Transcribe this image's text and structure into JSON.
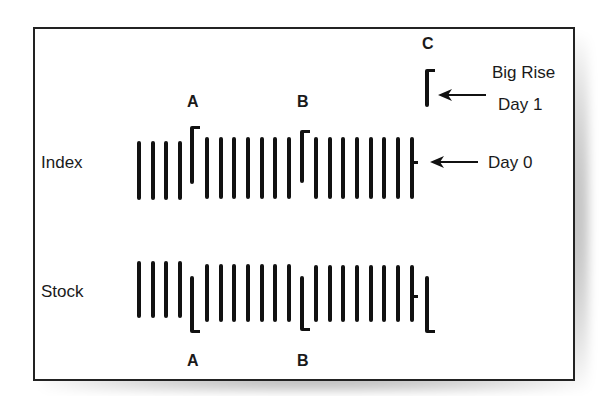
{
  "figure": {
    "row_labels": {
      "index": "Index",
      "stock": "Stock"
    },
    "markers": {
      "a_top": "A",
      "b_top": "B",
      "c_top": "C",
      "a_bottom": "A",
      "b_bottom": "B"
    },
    "annotations": {
      "big_rise": "Big Rise",
      "day1": "Day 1",
      "day0": "Day 0"
    },
    "colors": {
      "ink": "#111111",
      "background": "#ffffff",
      "frame": "#222222"
    }
  },
  "index_bars": [
    {
      "x": 139,
      "top": 141,
      "bottom": 200
    },
    {
      "x": 153,
      "top": 141,
      "bottom": 200
    },
    {
      "x": 166,
      "top": 141,
      "bottom": 200
    },
    {
      "x": 180,
      "top": 141,
      "bottom": 200
    },
    {
      "x": 192,
      "top": 126,
      "bottom": 184,
      "flag": "top"
    },
    {
      "x": 207,
      "top": 137,
      "bottom": 199
    },
    {
      "x": 221,
      "top": 137,
      "bottom": 199
    },
    {
      "x": 234,
      "top": 137,
      "bottom": 199
    },
    {
      "x": 248,
      "top": 137,
      "bottom": 199
    },
    {
      "x": 262,
      "top": 137,
      "bottom": 199
    },
    {
      "x": 275,
      "top": 137,
      "bottom": 199
    },
    {
      "x": 289,
      "top": 137,
      "bottom": 199
    },
    {
      "x": 302,
      "top": 130,
      "bottom": 183,
      "flag": "top"
    },
    {
      "x": 316,
      "top": 137,
      "bottom": 199
    },
    {
      "x": 330,
      "top": 137,
      "bottom": 199
    },
    {
      "x": 343,
      "top": 137,
      "bottom": 199
    },
    {
      "x": 357,
      "top": 137,
      "bottom": 199
    },
    {
      "x": 371,
      "top": 137,
      "bottom": 199
    },
    {
      "x": 384,
      "top": 137,
      "bottom": 199
    },
    {
      "x": 398,
      "top": 137,
      "bottom": 199
    },
    {
      "x": 412,
      "top": 137,
      "bottom": 199,
      "tick": 162
    },
    {
      "x": 427,
      "top": 69,
      "bottom": 107,
      "flag": "top"
    }
  ],
  "stock_bars": [
    {
      "x": 139,
      "top": 261,
      "bottom": 318
    },
    {
      "x": 153,
      "top": 261,
      "bottom": 318
    },
    {
      "x": 166,
      "top": 261,
      "bottom": 318
    },
    {
      "x": 180,
      "top": 261,
      "bottom": 318
    },
    {
      "x": 192,
      "top": 276,
      "bottom": 333,
      "flag": "bottom"
    },
    {
      "x": 207,
      "top": 264,
      "bottom": 322
    },
    {
      "x": 221,
      "top": 264,
      "bottom": 322
    },
    {
      "x": 234,
      "top": 264,
      "bottom": 322
    },
    {
      "x": 248,
      "top": 264,
      "bottom": 322
    },
    {
      "x": 262,
      "top": 264,
      "bottom": 322
    },
    {
      "x": 275,
      "top": 264,
      "bottom": 322
    },
    {
      "x": 289,
      "top": 264,
      "bottom": 322
    },
    {
      "x": 302,
      "top": 276,
      "bottom": 331,
      "flag": "bottom"
    },
    {
      "x": 316,
      "top": 265,
      "bottom": 322
    },
    {
      "x": 330,
      "top": 265,
      "bottom": 322
    },
    {
      "x": 343,
      "top": 265,
      "bottom": 322
    },
    {
      "x": 357,
      "top": 265,
      "bottom": 322
    },
    {
      "x": 371,
      "top": 265,
      "bottom": 322
    },
    {
      "x": 384,
      "top": 265,
      "bottom": 322
    },
    {
      "x": 398,
      "top": 265,
      "bottom": 322
    },
    {
      "x": 412,
      "top": 265,
      "bottom": 322,
      "tick": 296
    },
    {
      "x": 427,
      "top": 276,
      "bottom": 333,
      "flag": "bottom"
    }
  ]
}
